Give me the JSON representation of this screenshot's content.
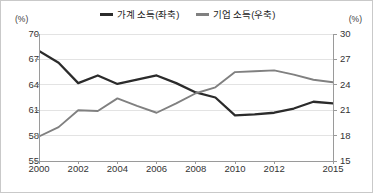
{
  "figure": {
    "left_axis_unit": "(%)",
    "right_axis_unit": "(%)"
  },
  "legend": {
    "items": [
      {
        "label": "가계 소득(좌축)",
        "color": "#2b2b2b",
        "name": "household-income"
      },
      {
        "label": "기업 소득(우축)",
        "color": "#808080",
        "name": "corporate-income"
      }
    ]
  },
  "axes": {
    "left_ticks": [
      "70",
      "67",
      "64",
      "61",
      "58",
      "55"
    ],
    "right_ticks": [
      "30",
      "27",
      "24",
      "21",
      "18",
      "15"
    ],
    "x_ticks": [
      "2000",
      "2002",
      "2004",
      "2006",
      "2008",
      "2010",
      "2012",
      "2015"
    ]
  },
  "colors": {
    "household_line": "#2b2b2b",
    "corporate_line": "#808080",
    "grid": "#e3e3e3",
    "axis": "#9a9a9a",
    "border": "#c9c9c9",
    "text": "#333333"
  },
  "chart_data": {
    "type": "line",
    "title": "",
    "xlabel": "",
    "ylabel": "",
    "x": [
      2000,
      2001,
      2002,
      2003,
      2004,
      2005,
      2006,
      2007,
      2008,
      2009,
      2010,
      2011,
      2012,
      2013,
      2014,
      2015
    ],
    "grid": true,
    "legend_position": "top-center",
    "series": [
      {
        "name": "가계 소득(좌축)",
        "axis": "left",
        "color": "#2b2b2b",
        "values": [
          68.0,
          66.6,
          64.2,
          65.1,
          64.1,
          64.6,
          65.1,
          64.2,
          63.1,
          62.5,
          60.4,
          60.5,
          60.7,
          61.2,
          62.0,
          61.8
        ],
        "ylim": [
          55,
          70
        ],
        "yticks": [
          55,
          58,
          61,
          64,
          67,
          70
        ],
        "unit": "(%)"
      },
      {
        "name": "기업 소득(우축)",
        "axis": "right",
        "color": "#808080",
        "values": [
          17.9,
          19.0,
          21.0,
          20.9,
          22.4,
          21.5,
          20.7,
          21.8,
          23.0,
          23.7,
          25.5,
          25.6,
          25.7,
          25.2,
          24.6,
          24.3
        ],
        "ylim": [
          15,
          30
        ],
        "yticks": [
          15,
          18,
          21,
          24,
          27,
          30
        ],
        "unit": "(%)"
      }
    ],
    "xlim": [
      2000,
      2015
    ],
    "xtick_values": [
      2000,
      2002,
      2004,
      2006,
      2008,
      2010,
      2012,
      2015
    ]
  }
}
